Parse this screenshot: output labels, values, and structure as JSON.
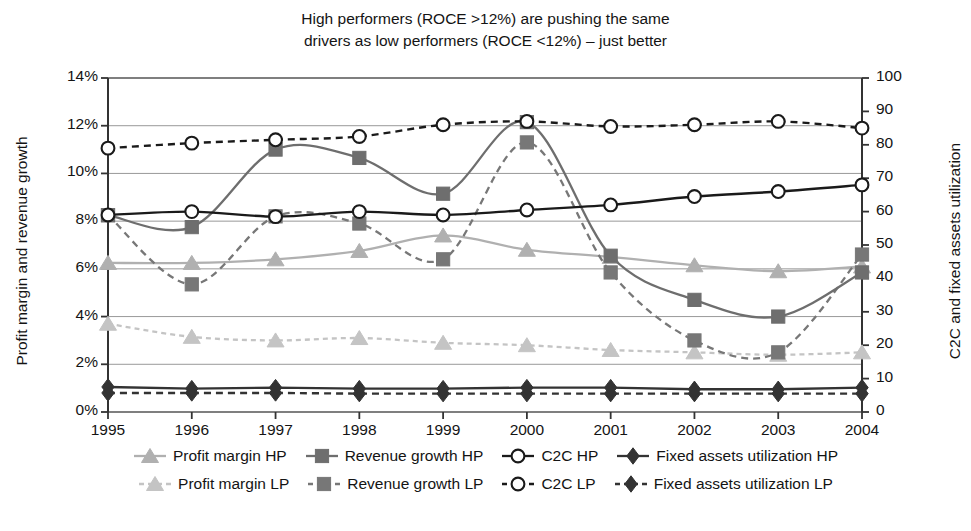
{
  "title": {
    "line1": "High performers (ROCE >12%) are pushing the same",
    "line2": "drivers as low performers (ROCE <12%) – just better"
  },
  "axes": {
    "left_title": "Profit margin and revenue growth",
    "right_title": "C2C and fixed assets utilization",
    "left_ticks": [
      "0%",
      "2%",
      "4%",
      "6%",
      "8%",
      "10%",
      "12%",
      "14%"
    ],
    "right_ticks": [
      "0",
      "10",
      "20",
      "30",
      "40",
      "50",
      "60",
      "70",
      "80",
      "90",
      "100"
    ],
    "x_ticks": [
      "1995",
      "1996",
      "1997",
      "1998",
      "1999",
      "2000",
      "2001",
      "2002",
      "2003",
      "2004"
    ]
  },
  "legend": {
    "row1": [
      {
        "label": "Profit margin HP",
        "marker": "triangle-icon",
        "style": "solid",
        "color": "#b0b0b0"
      },
      {
        "label": "Revenue growth HP",
        "marker": "square-icon",
        "style": "solid",
        "color": "#6e6e6e"
      },
      {
        "label": "C2C HP",
        "marker": "circle-open-icon",
        "style": "solid",
        "color": "#1a1a1a"
      },
      {
        "label": "Fixed assets utilization HP",
        "marker": "diamond-icon",
        "style": "solid",
        "color": "#333333"
      }
    ],
    "row2": [
      {
        "label": "Profit margin LP",
        "marker": "triangle-icon",
        "style": "dashed",
        "color": "#c4c4c4"
      },
      {
        "label": "Revenue growth LP",
        "marker": "square-icon",
        "style": "dashed",
        "color": "#777777"
      },
      {
        "label": "C2C LP",
        "marker": "circle-open-icon",
        "style": "dashed",
        "color": "#1a1a1a"
      },
      {
        "label": "Fixed assets utilization LP",
        "marker": "diamond-icon",
        "style": "dashed",
        "color": "#333333"
      }
    ]
  },
  "chart_data": {
    "type": "line",
    "title": "High performers (ROCE >12%) are pushing the same drivers as low performers (ROCE <12%) – just better",
    "xlabel": "",
    "ylabel": "Profit margin and revenue growth",
    "y2label": "C2C and fixed assets utilization",
    "x": [
      "1995",
      "1996",
      "1997",
      "1998",
      "1999",
      "2000",
      "2001",
      "2002",
      "2003",
      "2004"
    ],
    "ylim": [
      0,
      14
    ],
    "y2lim": [
      0,
      100
    ],
    "grid": true,
    "legend_position": "bottom",
    "series": [
      {
        "name": "Profit margin HP",
        "axis": "left",
        "unit": "%",
        "style": "solid",
        "marker": "triangle",
        "color": "#b0b0b0",
        "values": [
          6.25,
          6.25,
          6.4,
          6.75,
          7.4,
          6.8,
          6.5,
          6.15,
          5.9,
          6.1
        ]
      },
      {
        "name": "Profit margin LP",
        "axis": "left",
        "unit": "%",
        "style": "dashed",
        "marker": "triangle",
        "color": "#c4c4c4",
        "values": [
          3.7,
          3.15,
          3.0,
          3.1,
          2.9,
          2.8,
          2.6,
          2.5,
          2.4,
          2.5
        ]
      },
      {
        "name": "Revenue growth HP",
        "axis": "left",
        "unit": "%",
        "style": "solid",
        "marker": "square",
        "color": "#6e6e6e",
        "values": [
          8.25,
          7.75,
          11.0,
          10.65,
          9.15,
          12.15,
          6.55,
          4.7,
          4.0,
          5.85
        ]
      },
      {
        "name": "Revenue growth LP",
        "axis": "left",
        "unit": "%",
        "style": "dashed",
        "marker": "square",
        "color": "#777777",
        "values": [
          8.25,
          5.35,
          8.2,
          7.9,
          6.4,
          11.3,
          5.85,
          3.0,
          2.5,
          6.6
        ]
      },
      {
        "name": "C2C HP",
        "axis": "right",
        "unit": "",
        "style": "solid",
        "marker": "circle-open",
        "color": "#1a1a1a",
        "values": [
          59,
          60,
          58.5,
          60,
          59,
          60.5,
          62,
          64.5,
          66,
          68
        ]
      },
      {
        "name": "C2C LP",
        "axis": "right",
        "unit": "",
        "style": "dashed",
        "marker": "circle-open",
        "color": "#1a1a1a",
        "values": [
          79,
          80.5,
          81.5,
          82.5,
          86,
          87,
          85.5,
          86,
          87,
          85
        ]
      },
      {
        "name": "Fixed assets utilization HP",
        "axis": "right",
        "unit": "",
        "style": "solid",
        "marker": "diamond",
        "color": "#333333",
        "values": [
          7.5,
          7.0,
          7.3,
          7.0,
          7.0,
          7.3,
          7.3,
          6.8,
          6.8,
          7.3
        ]
      },
      {
        "name": "Fixed assets utilization LP",
        "axis": "right",
        "unit": "",
        "style": "dashed",
        "marker": "diamond",
        "color": "#333333",
        "values": [
          5.7,
          5.7,
          5.7,
          5.5,
          5.5,
          5.5,
          5.5,
          5.5,
          5.5,
          5.5
        ]
      }
    ]
  }
}
